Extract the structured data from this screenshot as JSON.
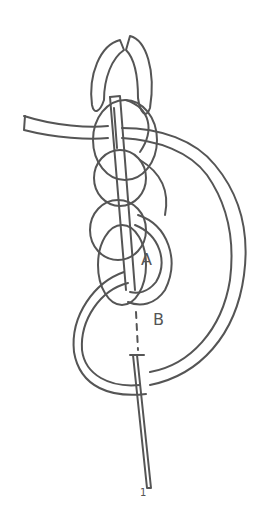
{
  "diagram": {
    "type": "chain stitch embroidery illustration",
    "stroke_color": "#555555",
    "background": "#ffffff",
    "labels": {
      "a": "A",
      "b": "B",
      "bottom_mark": "1"
    }
  }
}
